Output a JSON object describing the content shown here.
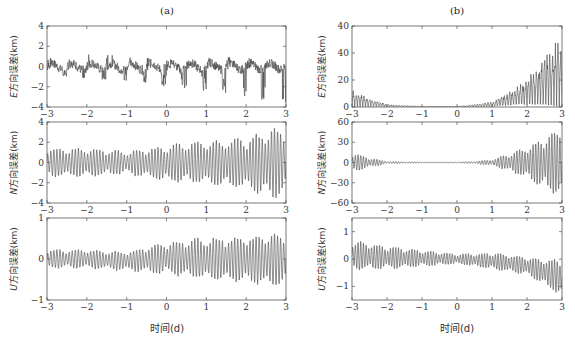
{
  "figure": {
    "panel_a_title": "(a)",
    "panel_b_title": "(b)",
    "x_axis_label": "时间(d)"
  },
  "chart_data": [
    {
      "id": "a-E",
      "type": "line",
      "panel": "(a)",
      "ylabel": "E方向误差(km)",
      "xlabel": "",
      "xlim": [
        -3,
        3
      ],
      "ylim": [
        -4,
        4
      ],
      "xticks": [
        -3,
        -2,
        -1,
        0,
        1,
        2,
        3
      ],
      "yticks": [
        -4,
        -2,
        0,
        2,
        4
      ],
      "ytick_labels": [
        "-4",
        "-2",
        "0",
        "2",
        "4"
      ],
      "description": "Oscillating error with ~0.5-day periodic negative spikes; baseline ~0, slight drift to -0.5 near t=3; spikes reach about -4 near t=2.7",
      "envelope": {
        "x": [
          -3,
          -2,
          -1,
          0,
          1,
          2,
          3
        ],
        "upper": [
          0.8,
          1.5,
          1.0,
          0.7,
          0.9,
          1.0,
          0.5
        ],
        "lower": [
          -0.8,
          -1.3,
          -1.7,
          -2.0,
          -2.5,
          -3.0,
          -4.0
        ]
      }
    },
    {
      "id": "b-E",
      "type": "line",
      "panel": "(b)",
      "ylabel": "E方向误差(km)",
      "xlabel": "",
      "xlim": [
        -3,
        3
      ],
      "ylim": [
        0,
        60
      ],
      "xticks": [
        -3,
        -2,
        -1,
        0,
        1,
        2,
        3
      ],
      "yticks": [
        0,
        20,
        40,
        60
      ],
      "ytick_labels": [
        "0",
        "20",
        "40",
        "40"
      ],
      "description": "Non-negative oscillating error; ~12 km at t=-3 decaying to ~0 by t=-2, near zero until t=1, then growing rapidly to ~55 km at t=3",
      "envelope": {
        "x": [
          -3,
          -2.5,
          -2,
          -1,
          0,
          0.5,
          1,
          1.5,
          2,
          2.5,
          3
        ],
        "upper": [
          13,
          7,
          2,
          0.5,
          0.5,
          2,
          4,
          12,
          22,
          38,
          55
        ],
        "lower": [
          0,
          0,
          0,
          0,
          0,
          0,
          0,
          0,
          0,
          0,
          0
        ]
      }
    },
    {
      "id": "a-N",
      "type": "line",
      "panel": "(a)",
      "ylabel": "N方向误差(km)",
      "xlabel": "",
      "xlim": [
        -3,
        3
      ],
      "ylim": [
        -4,
        4
      ],
      "xticks": [
        -3,
        -2,
        -1,
        0,
        1,
        2,
        3
      ],
      "yticks": [
        -4,
        -2,
        0,
        2,
        4
      ],
      "ytick_labels": [
        "-4",
        "-2",
        "0",
        "2",
        "4"
      ],
      "description": "Beat-pattern oscillation around 0 with amplitude growing from ~1.5 to ~3.8 at t≈2.7",
      "envelope": {
        "x": [
          -3,
          -2,
          -1,
          0,
          1,
          2,
          2.7,
          3
        ],
        "upper": [
          1.5,
          1.5,
          1.2,
          1.8,
          2.3,
          2.6,
          3.8,
          3.2
        ],
        "lower": [
          -1.5,
          -1.5,
          -1.2,
          -2.0,
          -2.3,
          -2.8,
          -3.8,
          -3.0
        ]
      }
    },
    {
      "id": "b-N",
      "type": "line",
      "panel": "(b)",
      "ylabel": "N方向误差(km)",
      "xlabel": "",
      "xlim": [
        -3,
        3
      ],
      "ylim": [
        -60,
        60
      ],
      "xticks": [
        -3,
        -2,
        -1,
        0,
        1,
        2,
        3
      ],
      "yticks": [
        -60,
        -30,
        0,
        30,
        60
      ],
      "ytick_labels": [
        "-60",
        "-30",
        "0",
        "30",
        "60"
      ],
      "description": "Symmetric oscillation; ±15 km at t=-3 shrinking to ~±1 by t=-2, near zero to t=0.5, then growing to ±58 at t=3",
      "envelope": {
        "x": [
          -3,
          -2.5,
          -2,
          -1,
          0,
          0.5,
          1,
          1.5,
          2,
          2.5,
          3
        ],
        "upper": [
          15,
          8,
          2,
          1,
          1,
          2,
          5,
          14,
          25,
          40,
          58
        ],
        "lower": [
          -15,
          -8,
          -2,
          -1,
          -1,
          -2,
          -5,
          -14,
          -25,
          -40,
          -58
        ]
      }
    },
    {
      "id": "a-U",
      "type": "line",
      "panel": "(a)",
      "ylabel": "U方向误差(km)",
      "xlabel": "时间(d)",
      "xlim": [
        -3,
        3
      ],
      "ylim": [
        -1,
        1
      ],
      "xticks": [
        -3,
        -2,
        -1,
        0,
        1,
        2,
        3
      ],
      "yticks": [
        -1,
        0,
        1
      ],
      "ytick_labels": [
        "-1",
        "0",
        "1"
      ],
      "description": "Beat-pattern oscillation around 0, amplitude ~0.25 at start growing to ~0.7 near t=2.7",
      "envelope": {
        "x": [
          -3,
          -2,
          -1,
          0,
          1,
          2,
          2.7,
          3
        ],
        "upper": [
          0.25,
          0.25,
          0.2,
          0.45,
          0.55,
          0.6,
          0.7,
          0.6
        ],
        "lower": [
          -0.25,
          -0.25,
          -0.3,
          -0.4,
          -0.55,
          -0.6,
          -0.75,
          -0.6
        ]
      }
    },
    {
      "id": "b-U",
      "type": "line",
      "panel": "(b)",
      "ylabel": "U方向误差(km)",
      "xlabel": "时间(d)",
      "xlim": [
        -3,
        3
      ],
      "ylim": [
        -1.5,
        1.5
      ],
      "xticks": [
        -3,
        -2,
        -1,
        0,
        1,
        2,
        3
      ],
      "yticks": [
        -1,
        0,
        1
      ],
      "ytick_labels": [
        "-1",
        "0",
        "1"
      ],
      "description": "Oscillation around 0 with amplitude ~0.7 at t=-3 decaying toward ~0.2 at t=0, then drifting negative to ~-1.4 at t=3",
      "envelope": {
        "x": [
          -3,
          -2,
          -1,
          0,
          1,
          2,
          3
        ],
        "upper": [
          0.7,
          0.5,
          0.35,
          0.2,
          0.25,
          0.1,
          0.0
        ],
        "lower": [
          -0.45,
          -0.4,
          -0.3,
          -0.2,
          -0.4,
          -0.6,
          -1.4
        ]
      }
    }
  ]
}
